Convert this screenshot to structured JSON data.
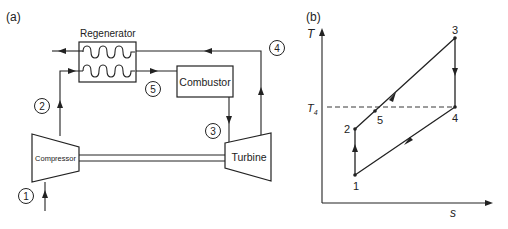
{
  "panel_a": {
    "label": "(a)",
    "components": {
      "regenerator": "Regenerator",
      "combustor": "Combustor",
      "compressor": "Compressor",
      "turbine": "Turbine"
    },
    "state_points": [
      "1",
      "2",
      "3",
      "4",
      "5"
    ]
  },
  "panel_b": {
    "label": "(b)",
    "y_axis": "T",
    "x_axis": "s",
    "reference_line": {
      "label": "T",
      "subscript": "4"
    },
    "points": [
      {
        "id": "1",
        "label": "1"
      },
      {
        "id": "2",
        "label": "2"
      },
      {
        "id": "3",
        "label": "3"
      },
      {
        "id": "4",
        "label": "4"
      },
      {
        "id": "5",
        "label": "5"
      }
    ]
  },
  "colors": {
    "line": "#222222",
    "background": "#ffffff"
  }
}
